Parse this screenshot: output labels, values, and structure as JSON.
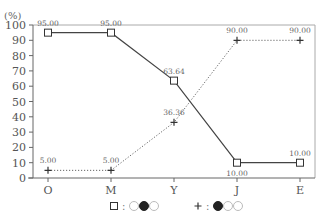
{
  "chart_data": {
    "type": "line",
    "title": "",
    "xlabel": "",
    "ylabel": "(%)",
    "ylim": [
      0,
      100
    ],
    "yticks": [
      0,
      10,
      20,
      30,
      40,
      50,
      60,
      70,
      80,
      90,
      100
    ],
    "grid": false,
    "categories": [
      "O",
      "M",
      "Y",
      "J",
      "E"
    ],
    "series": [
      {
        "name": "□ : ○●○",
        "marker": "square",
        "line_style": "solid",
        "color": "#444444",
        "values": [
          95.0,
          95.0,
          63.64,
          10.0,
          10.0
        ],
        "labels": [
          "95.00",
          "95.00",
          "63.64",
          "10.00",
          "10.00"
        ]
      },
      {
        "name": "+ : ●○○",
        "marker": "plus",
        "line_style": "dotted",
        "color": "#666666",
        "values": [
          5.0,
          5.0,
          36.36,
          90.0,
          90.0
        ],
        "labels": [
          "5.00",
          "5.00",
          "36.36",
          "90.00",
          "90.00"
        ]
      }
    ],
    "legend": {
      "position": "bottom",
      "entries": [
        {
          "marker": "square",
          "separator": ":",
          "pattern": [
            "empty",
            "filled",
            "empty"
          ]
        },
        {
          "marker": "plus",
          "separator": ":",
          "pattern": [
            "filled",
            "empty",
            "empty"
          ]
        }
      ]
    }
  },
  "axis": {
    "y_unit": "(%)",
    "y_tick_labels": [
      "0",
      "10",
      "20",
      "30",
      "40",
      "50",
      "60",
      "70",
      "80",
      "90",
      "100"
    ],
    "x_tick_labels": [
      "O",
      "M",
      "Y",
      "J",
      "E"
    ]
  },
  "legend": {
    "separator": ":"
  }
}
